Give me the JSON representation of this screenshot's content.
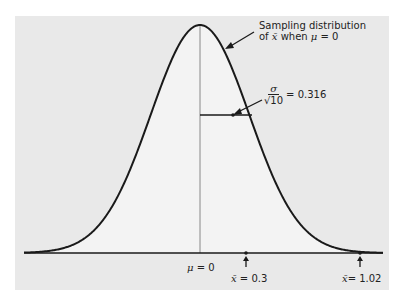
{
  "chart_data": {
    "type": "line",
    "title": "",
    "xlabel": "",
    "ylabel": "",
    "grid": false,
    "legend": null,
    "distribution": "normal",
    "mean": 0,
    "sd": 0.316,
    "xlim": [
      -1.13,
      1.18
    ],
    "ticks": [
      {
        "x": 0,
        "label": "μ = 0"
      },
      {
        "x": 0.3,
        "label": "x̄ = 0.3"
      },
      {
        "x": 1.02,
        "label": "x̄= 1.02"
      }
    ],
    "annotations": [
      {
        "text": "Sampling distribution of x̄ when μ = 0",
        "target": "curve"
      },
      {
        "text": "σ/√10 = 0.316",
        "target": "one-sd half-width line"
      }
    ]
  },
  "labels": {
    "curve_line1": "Sampling distribution",
    "curve_line2_pre": "of ",
    "curve_xbar": "x̄",
    "curve_line2_mid": " when ",
    "curve_mu": "μ",
    "curve_line2_post": " = 0",
    "sigma": "σ",
    "sqrt10": "√10",
    "sd_value": "= 0.316",
    "mu_label": "μ",
    "mu_value": " = 0",
    "x1_sym": "x̄",
    "x1_value": " = 0.3",
    "x2_sym": "x̄",
    "x2_value": "= 1.02"
  },
  "colors": {
    "panel": "#e9e9e9",
    "under_curve": "#f3f3f3",
    "line": "#1a1a1a"
  }
}
